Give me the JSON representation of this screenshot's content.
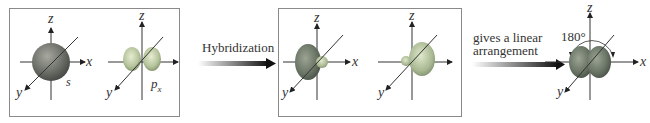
{
  "diagram": {
    "panels": [
      {
        "name": "atomic-orbitals",
        "orbitals": [
          {
            "type": "s",
            "label": "s"
          },
          {
            "type": "p",
            "label": "p",
            "subscript": "x"
          }
        ]
      },
      {
        "name": "hybrid-orbitals",
        "orbitals": [
          {
            "type": "sp-left"
          },
          {
            "type": "sp-right"
          }
        ]
      }
    ],
    "axes": {
      "x": "x",
      "y": "y",
      "z": "z"
    },
    "arrow1": {
      "label": "Hybridization"
    },
    "arrow2": {
      "line1": "gives a linear",
      "line2": "arrangement"
    },
    "result": {
      "angle": "180°"
    },
    "colors": {
      "orbital": "#7a8a7a",
      "orbital_light": "#c8d4b8",
      "axis": "#333333",
      "border": "#8a8a8a"
    }
  }
}
